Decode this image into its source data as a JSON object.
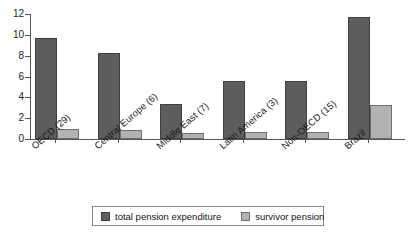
{
  "chart_data": {
    "type": "bar",
    "title": "",
    "xlabel": "",
    "ylabel": "",
    "ylim": [
      0,
      12
    ],
    "yticks": [
      0,
      2,
      4,
      6,
      8,
      10,
      12
    ],
    "grid": false,
    "legend_position": "bottom",
    "categories": [
      "OECD (29)",
      "Central Europe (6)",
      "Middle East (7)",
      "Latin America (3)",
      "Non-OECD (15)",
      "Brazil"
    ],
    "series": [
      {
        "name": "total pension expenditure",
        "color": "#5d5d5d",
        "values": [
          9.7,
          8.3,
          3.4,
          5.6,
          5.6,
          11.7
        ]
      },
      {
        "name": "survivor pension",
        "color": "#b2b2b2",
        "values": [
          1.0,
          0.85,
          0.6,
          0.65,
          0.7,
          3.3
        ]
      }
    ]
  },
  "axis": {
    "tick_labels": [
      "0",
      "2",
      "4",
      "6",
      "8",
      "10",
      "12"
    ]
  },
  "legend": {
    "entries": [
      {
        "label": "total pension expenditure",
        "swatch": "#5d5d5d"
      },
      {
        "label": "survivor pension",
        "swatch": "#b2b2b2"
      }
    ]
  }
}
